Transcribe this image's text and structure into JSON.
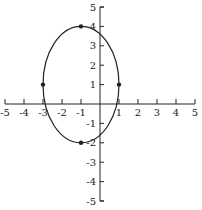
{
  "chart_data": {
    "type": "line",
    "title": "",
    "xlabel": "",
    "ylabel": "",
    "xlim": [
      -5,
      5
    ],
    "ylim": [
      -5,
      5
    ],
    "grid": false,
    "x_ticks": [
      "-5",
      "-4",
      "-3",
      "-2",
      "-1",
      "1",
      "2",
      "3",
      "4",
      "5"
    ],
    "y_ticks": [
      "5",
      "4",
      "3",
      "2",
      "1",
      "-1",
      "-2",
      "-3",
      "-4",
      "-5"
    ],
    "series": [
      {
        "name": "ellipse",
        "shape": "ellipse",
        "center": [
          -1,
          1
        ],
        "semi_axis_x": 2,
        "semi_axis_y": 3,
        "equation": "(x+1)^2/4 + (y-1)^2/9 = 1"
      }
    ],
    "points": [
      {
        "x": -1,
        "y": 4
      },
      {
        "x": -1,
        "y": -2
      },
      {
        "x": -3,
        "y": 1
      },
      {
        "x": 1,
        "y": 1
      }
    ]
  },
  "colors": {
    "ink": "#222222",
    "background": "#ffffff"
  }
}
